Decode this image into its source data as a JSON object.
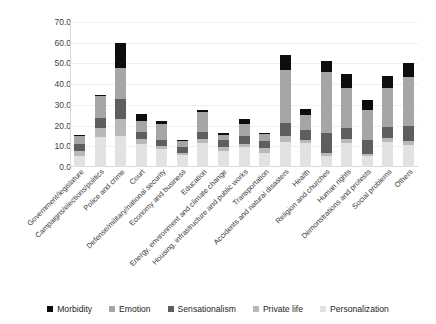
{
  "chart_data": {
    "type": "bar",
    "title": "",
    "subtitle": "",
    "xlabel": "",
    "ylabel": "",
    "stacked": true,
    "grid": true,
    "legend_position": "bottom",
    "ylim": [
      0,
      70
    ],
    "yticks": [
      "0.0",
      "10.0",
      "20.0",
      "30.0",
      "40.0",
      "50.0",
      "60.0",
      "70.0"
    ],
    "ytick_values": [
      0,
      10,
      20,
      30,
      40,
      50,
      60,
      70
    ],
    "categories": [
      "Government/legislature",
      "Campaigns/elections/politics",
      "Police and crime",
      "Court",
      "Defense/military/national security",
      "Economy and business",
      "Education",
      "Energy, environment and climate change",
      "Housing, infrastructure and public works",
      "Transportation",
      "Accidents and natural disasters",
      "Health",
      "Religion and churches",
      "Human rights",
      "Demonstrations and protests",
      "Social problems",
      "Others"
    ],
    "series": [
      {
        "name": "Personalization",
        "color": "#e2e2e2",
        "values": [
          5.5,
          14.5,
          15.0,
          11.0,
          8.5,
          6.0,
          11.5,
          7.5,
          9.5,
          7.0,
          12.0,
          11.5,
          5.5,
          11.5,
          5.5,
          12.0,
          10.5
        ]
      },
      {
        "name": "Private life",
        "color": "#b9b9b9",
        "values": [
          2.0,
          4.5,
          8.0,
          2.5,
          1.5,
          1.0,
          2.0,
          2.0,
          1.5,
          2.0,
          3.0,
          1.5,
          1.5,
          2.0,
          1.0,
          2.0,
          2.0
        ]
      },
      {
        "name": "Sensationalism",
        "color": "#5e5e5e",
        "values": [
          3.5,
          4.5,
          10.0,
          3.5,
          3.0,
          2.5,
          3.5,
          3.5,
          4.0,
          3.5,
          6.5,
          5.0,
          9.5,
          5.5,
          6.5,
          5.5,
          7.5
        ]
      },
      {
        "name": "Emotion",
        "color": "#a6a6a6",
        "values": [
          4.0,
          11.0,
          15.0,
          5.0,
          8.0,
          3.0,
          9.5,
          2.5,
          6.0,
          3.5,
          25.5,
          7.0,
          29.5,
          19.0,
          14.5,
          18.5,
          23.5
        ]
      },
      {
        "name": "Morbidity",
        "color": "#0d0d0d",
        "values": [
          0.5,
          0.5,
          12.0,
          3.5,
          1.0,
          0.5,
          1.0,
          1.0,
          2.0,
          0.5,
          7.0,
          3.0,
          5.0,
          7.0,
          5.0,
          6.0,
          6.5
        ]
      }
    ],
    "totals": [
      15.5,
      35.0,
      60.0,
      25.5,
      22.0,
      13.0,
      27.5,
      16.5,
      23.0,
      16.5,
      54.0,
      28.0,
      51.0,
      45.0,
      32.5,
      44.0,
      50.0
    ]
  },
  "legend": {
    "items": [
      {
        "label": "Morbidity",
        "color": "#0d0d0d"
      },
      {
        "label": "Emotion",
        "color": "#a6a6a6"
      },
      {
        "label": "Sensationalism",
        "color": "#5e5e5e"
      },
      {
        "label": "Private life",
        "color": "#b9b9b9"
      },
      {
        "label": "Personalization",
        "color": "#e2e2e2"
      }
    ]
  }
}
